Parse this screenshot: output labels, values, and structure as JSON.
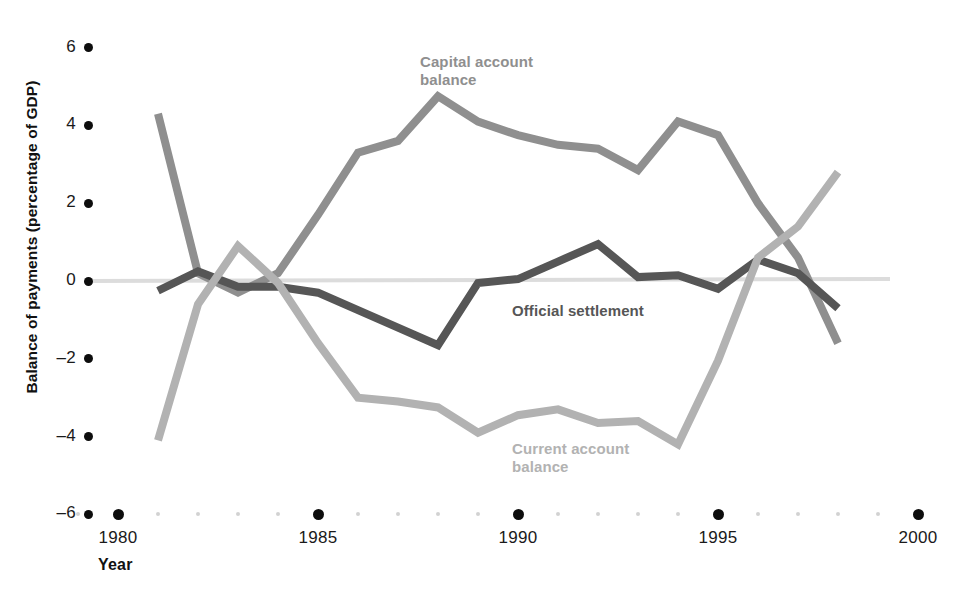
{
  "chart_data": {
    "type": "line",
    "title": "",
    "xlabel": "Year",
    "ylabel": "Balance of payments (percentage of GDP)",
    "xlim": [
      1979,
      2000
    ],
    "ylim": [
      -6,
      6
    ],
    "ytick_labels": [
      "6",
      "4",
      "2",
      "0",
      "–2",
      "–4",
      "–6"
    ],
    "ytick_values": [
      6,
      4,
      2,
      0,
      -2,
      -4,
      -6
    ],
    "xtick_labels": [
      "1980",
      "1985",
      "1990",
      "1995",
      "2000"
    ],
    "xtick_values": [
      1980,
      1985,
      1990,
      1995,
      2000
    ],
    "minor_x_years": [
      1979,
      1981,
      1982,
      1983,
      1984,
      1986,
      1987,
      1988,
      1989,
      1991,
      1992,
      1993,
      1994,
      1996,
      1997,
      1998,
      1999
    ],
    "grid": false,
    "legend_position": "inline-annotations",
    "zero_line": true,
    "x": [
      1981,
      1982,
      1983,
      1984,
      1985,
      1986,
      1987,
      1988,
      1989,
      1990,
      1991,
      1992,
      1993,
      1994,
      1995,
      1996,
      1997,
      1998
    ],
    "series": [
      {
        "name": "Capital account balance",
        "color": "#8f8f8f",
        "label_x": 1988.0,
        "label_y": 5.6,
        "values": [
          4.3,
          0.2,
          -0.3,
          0.2,
          1.7,
          3.3,
          3.6,
          4.75,
          4.1,
          3.75,
          3.5,
          3.4,
          2.85,
          4.1,
          3.75,
          2.0,
          0.6,
          -1.6
        ]
      },
      {
        "name": "Official settlement",
        "color": "#565656",
        "label_x": 1990.3,
        "label_y": -0.8,
        "values": [
          -0.25,
          0.25,
          -0.15,
          -0.15,
          -0.3,
          -0.75,
          -1.2,
          -1.65,
          -0.05,
          0.05,
          0.5,
          0.95,
          0.1,
          0.15,
          -0.2,
          0.55,
          0.2,
          -0.7
        ]
      },
      {
        "name": "Current account balance",
        "color": "#b2b2b2",
        "label_x": 1990.3,
        "label_y": -4.35,
        "values": [
          -4.1,
          -0.6,
          0.9,
          -0.05,
          -1.6,
          -3.0,
          -3.1,
          -3.25,
          -3.9,
          -3.45,
          -3.3,
          -3.65,
          -3.6,
          -4.2,
          -2.05,
          0.6,
          1.4,
          2.8
        ]
      }
    ]
  }
}
